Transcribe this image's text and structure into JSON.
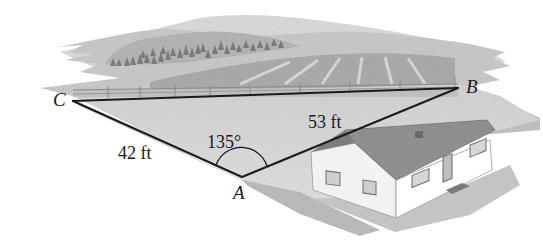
{
  "diagram": {
    "type": "triangle-word-problem-illustration",
    "vertices": [
      {
        "id": "A",
        "label": "A",
        "x": 242,
        "y": 177
      },
      {
        "id": "B",
        "label": "B",
        "x": 458,
        "y": 88
      },
      {
        "id": "C",
        "label": "C",
        "x": 73,
        "y": 101
      }
    ],
    "sides": [
      {
        "from": "C",
        "to": "A",
        "label": "42 ft"
      },
      {
        "from": "A",
        "to": "B",
        "label": "53 ft"
      },
      {
        "from": "C",
        "to": "B",
        "label": ""
      }
    ],
    "angle": {
      "vertex": "A",
      "label": "135°"
    },
    "scene_elements": [
      "hills",
      "trees",
      "plowed-field",
      "fence",
      "lawn",
      "house"
    ],
    "colors": {
      "line": "#1a1a1a",
      "lawn": "#d4d4d4",
      "hill_light": "#cfcfcf",
      "hill_mid": "#b4b4b4",
      "hill_dark": "#9a9a9a",
      "house_wall": "#f4f4f4",
      "house_roof": "#8e8e8e"
    }
  },
  "labels": {
    "vertex_a": "A",
    "vertex_b": "B",
    "vertex_c": "C",
    "side_ca": "42 ft",
    "side_ab": "53 ft",
    "angle_a": "135°"
  }
}
